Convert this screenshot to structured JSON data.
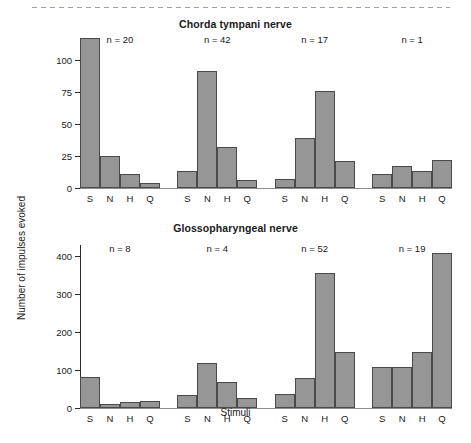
{
  "figure": {
    "y_axis_title": "Number of impulses evoked",
    "x_axis_title": "Stimuli"
  },
  "chart_data": [
    {
      "type": "bar",
      "title": "Chorda tympani nerve",
      "xlabel": "Stimuli",
      "ylabel": "Number of impulses evoked",
      "ylim": [
        0,
        117
      ],
      "yticks": [
        0,
        25,
        50,
        75,
        100
      ],
      "ytick_labels": [
        "0",
        "25",
        "50",
        "75",
        "100"
      ],
      "grid": false,
      "legend": "none",
      "categories": [
        "S",
        "N",
        "H",
        "Q"
      ],
      "groups": [
        {
          "annotation": "n = 20",
          "categories": [
            "S",
            "N",
            "H",
            "Q"
          ],
          "values": [
            117,
            25,
            11,
            4
          ]
        },
        {
          "annotation": "n = 42",
          "categories": [
            "S",
            "N",
            "H",
            "Q"
          ],
          "values": [
            13,
            91,
            32,
            6
          ]
        },
        {
          "annotation": "n = 17",
          "categories": [
            "S",
            "N",
            "H",
            "Q"
          ],
          "values": [
            7,
            39,
            76,
            21
          ]
        },
        {
          "annotation": "n = 1",
          "categories": [
            "S",
            "N",
            "H",
            "Q"
          ],
          "values": [
            11,
            17,
            13,
            22
          ]
        }
      ]
    },
    {
      "type": "bar",
      "title": "Glossopharyngeal nerve",
      "xlabel": "Stimuli",
      "ylabel": "Number of impulses evoked",
      "ylim": [
        0,
        430
      ],
      "yticks": [
        0,
        100,
        200,
        300,
        400
      ],
      "ytick_labels": [
        "0",
        "100",
        "200",
        "300",
        "400"
      ],
      "grid": false,
      "legend": "none",
      "categories": [
        "S",
        "N",
        "H",
        "Q"
      ],
      "groups": [
        {
          "annotation": "n = 8",
          "categories": [
            "S",
            "N",
            "H",
            "Q"
          ],
          "values": [
            83,
            11,
            17,
            18
          ]
        },
        {
          "annotation": "n = 4",
          "categories": [
            "S",
            "N",
            "H",
            "Q"
          ],
          "values": [
            35,
            118,
            68,
            26
          ]
        },
        {
          "annotation": "n = 52",
          "categories": [
            "S",
            "N",
            "H",
            "Q"
          ],
          "values": [
            38,
            80,
            355,
            147
          ]
        },
        {
          "annotation": "n = 19",
          "categories": [
            "S",
            "N",
            "H",
            "Q"
          ],
          "values": [
            108,
            108,
            149,
            410
          ]
        }
      ]
    }
  ],
  "style": {
    "bar_fill": "#969696",
    "bar_edge": "#4a4a4a",
    "axis_color": "#2b2b2b",
    "text_color": "#1a1a1a"
  }
}
